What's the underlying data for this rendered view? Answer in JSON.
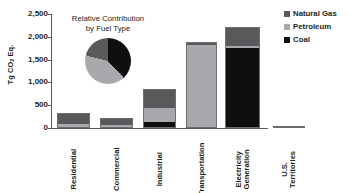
{
  "chart_data": {
    "type": "bar",
    "title": "",
    "xlabel": "",
    "ylabel": "Tg CO2 Eq.",
    "ylim": [
      0,
      2500
    ],
    "ytick_labels": [
      "0",
      "500",
      "1,000",
      "1,500",
      "2,000",
      "2,500"
    ],
    "ytick_values": [
      0,
      500,
      1000,
      1500,
      2000,
      2500
    ],
    "grid": false,
    "stacked": true,
    "legend_position": "right-top",
    "categories": [
      "Residential",
      "Commercial",
      "Industrial",
      "Transportation",
      "Electricity Generation",
      "U.S. Territories"
    ],
    "category_label_lines": [
      [
        "Residential"
      ],
      [
        "Commercial"
      ],
      [
        "Industrial"
      ],
      [
        "Transportation"
      ],
      [
        "Electricity",
        "Generation"
      ],
      [
        "U.S.",
        "Territories"
      ]
    ],
    "series": [
      {
        "name": "Coal",
        "color": "#0f0f0f",
        "values": [
          0,
          0,
          105,
          0,
          1760,
          0
        ]
      },
      {
        "name": "Petroleum",
        "color": "#a7a9ac",
        "values": [
          80,
          45,
          330,
          1840,
          55,
          50
        ]
      },
      {
        "name": "Natural Gas",
        "color": "#58595b",
        "values": [
          250,
          180,
          415,
          40,
          390,
          0
        ]
      }
    ],
    "totals": [
      330,
      225,
      850,
      1880,
      2205,
      50
    ],
    "annotations": []
  },
  "inset": {
    "title": "Relative Contribution\nby Fuel Type",
    "chart_data": {
      "type": "pie",
      "title": "Relative Contribution by Fuel Type",
      "labels": [
        "Coal",
        "Petroleum",
        "Natural Gas"
      ],
      "values": [
        38,
        41,
        21
      ],
      "colors": [
        "#0f0f0f",
        "#a7a9ac",
        "#58595b"
      ]
    }
  },
  "legend": {
    "items": [
      {
        "label": "Natural Gas",
        "color": "#58595b"
      },
      {
        "label": "Petroleum",
        "color": "#a7a9ac"
      },
      {
        "label": "Coal",
        "color": "#0f0f0f"
      }
    ]
  },
  "colors": {
    "natural_gas": "#58595b",
    "petroleum": "#a7a9ac",
    "coal": "#0f0f0f",
    "axis": "#58595b",
    "text": "#231f20",
    "background": "#ffffff"
  }
}
